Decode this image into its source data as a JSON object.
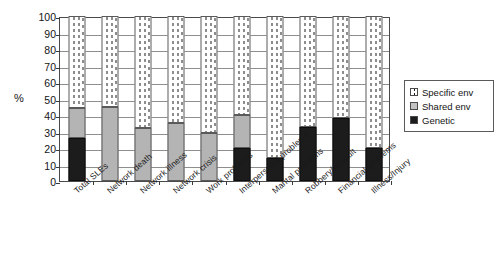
{
  "chart_data": {
    "type": "bar",
    "subtype": "stacked-bar-100",
    "title": "",
    "xlabel": "",
    "ylabel": "%",
    "ylim": [
      0,
      100
    ],
    "yticks": [
      0,
      10,
      20,
      30,
      40,
      50,
      60,
      70,
      80,
      90,
      100
    ],
    "grid": true,
    "legend_position": "right",
    "categories": [
      "Total SLEs",
      "Network death",
      "Network illness",
      "Network crisis",
      "Work problems",
      "Interpersonal problems",
      "Marital problems",
      "Robbery/Assault",
      "Financial problems",
      "Illness/Injury"
    ],
    "series": [
      {
        "name": "Genetic",
        "color": "#1c1c1c",
        "values": [
          26,
          0,
          0,
          0,
          0,
          20,
          14,
          33,
          38,
          20
        ]
      },
      {
        "name": "Shared env",
        "color": "#b4b4b4",
        "values": [
          18,
          45,
          32,
          35,
          29,
          20,
          0,
          0,
          0,
          0
        ]
      },
      {
        "name": "Specific env",
        "color": "#ffffff",
        "values": [
          56,
          55,
          68,
          65,
          71,
          60,
          86,
          67,
          62,
          80
        ]
      }
    ],
    "cumulative_tops": {
      "genetic": [
        26,
        0,
        0,
        0,
        0,
        20,
        14,
        33,
        38,
        20
      ],
      "genetic_plus_shared": [
        44,
        45,
        32,
        35,
        29,
        40,
        14,
        33,
        38,
        20
      ]
    }
  },
  "legend": {
    "items": [
      {
        "label": "Specific env",
        "swatch": "specific-env-swatch"
      },
      {
        "label": "Shared env",
        "swatch": "shared-env-swatch"
      },
      {
        "label": "Genetic",
        "swatch": "genetic-swatch"
      }
    ]
  }
}
